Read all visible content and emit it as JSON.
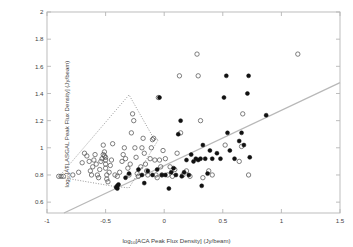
{
  "chart_data": {
    "type": "scatter",
    "title": "",
    "xlabel": "log10[ACA Peak Flux Density] (Jy/beam)",
    "ylabel": "log10[ATLASGAL Peak Flux Density] (Jy/beam)",
    "xlim": [
      -1,
      1.5
    ],
    "ylim": [
      0.52,
      2.0
    ],
    "xticks": [
      "-1",
      "-0.5",
      "0",
      "0.5",
      "1",
      "1.5"
    ],
    "xtick_values": [
      -1,
      -0.5,
      0,
      0.5,
      1,
      1.5
    ],
    "yticks": [
      "0.6",
      "0.8",
      "1",
      "1.2",
      "1.4",
      "1.6",
      "1.8",
      "2"
    ],
    "ytick_values": [
      0.6,
      0.8,
      1.0,
      1.2,
      1.4,
      1.6,
      1.8,
      2.0
    ],
    "grid": false,
    "legend": "none",
    "series": [
      {
        "name": "open circles",
        "marker": "open-circle",
        "color": "#555555",
        "points": [
          [
            -0.9,
            0.79
          ],
          [
            -0.88,
            0.79
          ],
          [
            -0.86,
            0.79
          ],
          [
            -0.78,
            0.8
          ],
          [
            -0.73,
            0.82
          ],
          [
            -0.7,
            0.89
          ],
          [
            -0.68,
            0.96
          ],
          [
            -0.66,
            0.94
          ],
          [
            -0.64,
            0.9
          ],
          [
            -0.63,
            0.83
          ],
          [
            -0.62,
            0.8
          ],
          [
            -0.61,
            0.86
          ],
          [
            -0.6,
            0.91
          ],
          [
            -0.59,
            0.95
          ],
          [
            -0.58,
            0.88
          ],
          [
            -0.57,
            0.8
          ],
          [
            -0.56,
            0.78
          ],
          [
            -0.55,
            0.84
          ],
          [
            -0.54,
            0.9
          ],
          [
            -0.53,
            0.92
          ],
          [
            -0.52,
            0.95
          ],
          [
            -0.52,
            1.02
          ],
          [
            -0.51,
            0.97
          ],
          [
            -0.51,
            0.94
          ],
          [
            -0.5,
            0.93
          ],
          [
            -0.5,
            0.91
          ],
          [
            -0.5,
            0.88
          ],
          [
            -0.5,
            0.85
          ],
          [
            -0.49,
            0.8
          ],
          [
            -0.49,
            0.77
          ],
          [
            -0.48,
            0.75
          ],
          [
            -0.47,
            0.82
          ],
          [
            -0.46,
            0.87
          ],
          [
            -0.45,
            0.91
          ],
          [
            -0.44,
            1.03
          ],
          [
            -0.42,
            0.8
          ],
          [
            -0.4,
            0.79
          ],
          [
            -0.38,
            0.82
          ],
          [
            -0.36,
            0.9
          ],
          [
            -0.35,
            0.95
          ],
          [
            -0.34,
            1.0
          ],
          [
            -0.33,
            0.92
          ],
          [
            -0.31,
            0.85
          ],
          [
            -0.3,
            0.8
          ],
          [
            -0.29,
            0.88
          ],
          [
            -0.28,
            1.11
          ],
          [
            -0.27,
            1.25
          ],
          [
            -0.26,
            1.2
          ],
          [
            -0.25,
            1.0
          ],
          [
            -0.24,
            0.93
          ],
          [
            -0.23,
            0.81
          ],
          [
            -0.22,
            0.79
          ],
          [
            -0.2,
            0.86
          ],
          [
            -0.19,
            1.0
          ],
          [
            -0.18,
            1.07
          ],
          [
            -0.17,
            0.96
          ],
          [
            -0.16,
            0.88
          ],
          [
            -0.15,
            0.83
          ],
          [
            -0.14,
            0.8
          ],
          [
            -0.12,
            0.92
          ],
          [
            -0.11,
            1.0
          ],
          [
            -0.1,
            1.06
          ],
          [
            -0.09,
            1.07
          ],
          [
            -0.08,
            0.91
          ],
          [
            -0.07,
            0.8
          ],
          [
            -0.06,
            0.78
          ],
          [
            -0.05,
            1.37
          ],
          [
            -0.04,
            0.91
          ],
          [
            -0.03,
            0.86
          ],
          [
            -0.02,
            0.8
          ],
          [
            -0.01,
            0.98
          ],
          [
            0.01,
            0.92
          ],
          [
            0.03,
            0.8
          ],
          [
            0.05,
            0.86
          ],
          [
            0.07,
            0.79
          ],
          [
            0.09,
            0.84
          ],
          [
            0.11,
            0.96
          ],
          [
            0.13,
            1.53
          ],
          [
            0.14,
            1.11
          ],
          [
            0.16,
            0.8
          ],
          [
            0.19,
            0.83
          ],
          [
            0.22,
            0.79
          ],
          [
            0.28,
            1.69
          ],
          [
            0.29,
            1.53
          ],
          [
            0.31,
            1.2
          ],
          [
            0.33,
            0.78
          ],
          [
            0.38,
            0.83
          ],
          [
            0.41,
            0.8
          ],
          [
            0.52,
            1.02
          ],
          [
            0.64,
            0.9
          ],
          [
            0.66,
            1.01
          ],
          [
            0.67,
            1.25
          ],
          [
            0.72,
            0.8
          ],
          [
            1.14,
            1.69
          ]
        ]
      },
      {
        "name": "filled circles",
        "marker": "filled-circle",
        "color": "#111111",
        "points": [
          [
            -0.41,
            0.71
          ],
          [
            -0.4,
            0.7
          ],
          [
            -0.4,
            0.72
          ],
          [
            -0.39,
            0.73
          ],
          [
            -0.33,
            0.78
          ],
          [
            -0.3,
            0.81
          ],
          [
            -0.22,
            0.84
          ],
          [
            -0.19,
            0.8
          ],
          [
            -0.17,
            0.74
          ],
          [
            -0.14,
            0.83
          ],
          [
            -0.1,
            0.8
          ],
          [
            -0.06,
            0.84
          ],
          [
            -0.04,
            1.37
          ],
          [
            -0.02,
            0.8
          ],
          [
            0.01,
            0.8
          ],
          [
            0.04,
            0.7
          ],
          [
            0.06,
            0.82
          ],
          [
            0.08,
            0.85
          ],
          [
            0.1,
            0.8
          ],
          [
            0.12,
            1.1
          ],
          [
            0.14,
            1.2
          ],
          [
            0.15,
            0.79
          ],
          [
            0.17,
            0.82
          ],
          [
            0.19,
            0.91
          ],
          [
            0.21,
            0.8
          ],
          [
            0.23,
            0.95
          ],
          [
            0.25,
            0.9
          ],
          [
            0.27,
            0.92
          ],
          [
            0.29,
            0.91
          ],
          [
            0.31,
            0.92
          ],
          [
            0.32,
            0.72
          ],
          [
            0.33,
            1.02
          ],
          [
            0.35,
            0.92
          ],
          [
            0.37,
            0.81
          ],
          [
            0.39,
            0.98
          ],
          [
            0.41,
            0.92
          ],
          [
            0.45,
            0.96
          ],
          [
            0.48,
            0.92
          ],
          [
            0.51,
            1.37
          ],
          [
            0.53,
            1.53
          ],
          [
            0.54,
            1.11
          ],
          [
            0.56,
            0.98
          ],
          [
            0.6,
            0.92
          ],
          [
            0.64,
            1.05
          ],
          [
            0.66,
            1.11
          ],
          [
            0.68,
            1.02
          ],
          [
            0.71,
            1.4
          ],
          [
            0.72,
            1.53
          ],
          [
            0.73,
            0.93
          ],
          [
            0.87,
            1.24
          ]
        ]
      }
    ],
    "reference_line": {
      "name": "one-to-one-trend-line",
      "style": "solid",
      "color": "#b8b8b8",
      "x1": -0.855,
      "y1": 0.52,
      "x2": 1.5,
      "y2": 1.48
    },
    "region_outline": {
      "name": "dotted-selection-region",
      "style": "dotted",
      "color": "#6b6b6b",
      "vertices": [
        [
          -0.9,
          0.785
        ],
        [
          -0.3,
          1.39
        ],
        [
          -0.09,
          1.07
        ],
        [
          -0.05,
          1.06
        ],
        [
          -0.3,
          0.705
        ],
        [
          -0.42,
          0.715
        ]
      ]
    }
  }
}
